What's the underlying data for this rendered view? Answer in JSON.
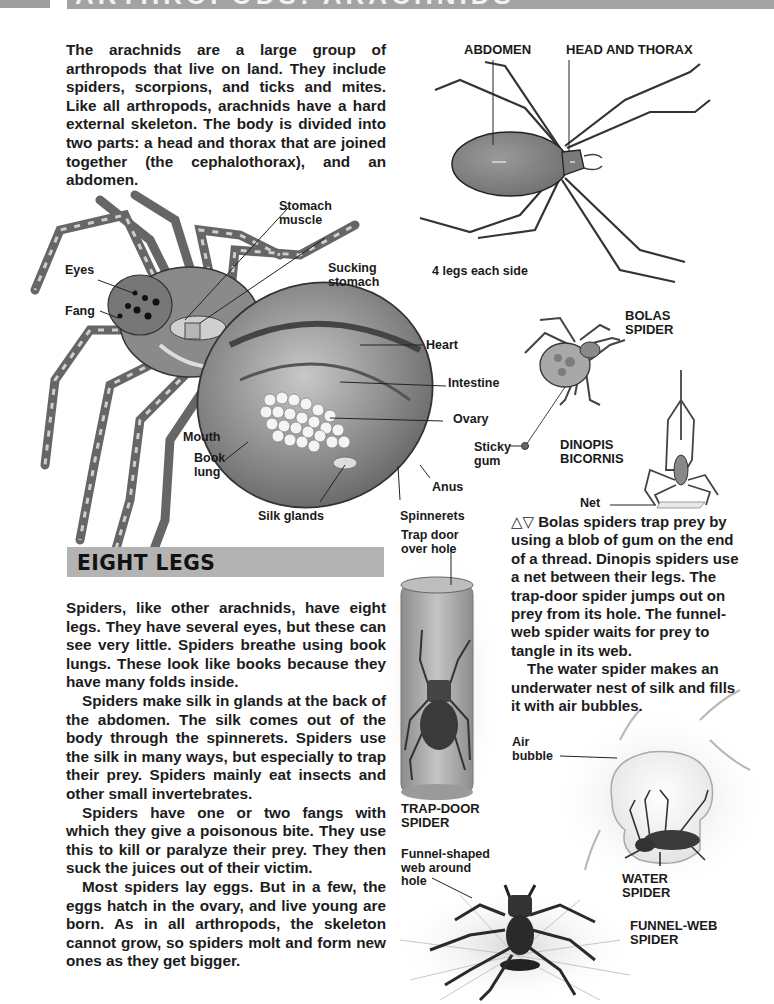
{
  "header": {
    "title": "ARTHROPODS: ARACHNIDS"
  },
  "intro": {
    "text": "The arachnids are a large group of arthropods that live on land. They include spiders, scorpions, and ticks and mites. Like all arthropods, arachnids have a hard external skeleton. The body is divided into two parts: a head and thorax that are joined together (the cephalothorax), and an abdomen."
  },
  "body_diagram": {
    "labels": {
      "abdomen": "ABDOMEN",
      "head_thorax": "HEAD AND THORAX",
      "legs_note": "4 legs each side"
    }
  },
  "anatomy": {
    "labels": {
      "stomach_muscle_1": "Stomach",
      "stomach_muscle_2": "muscle",
      "sucking_stomach_1": "Sucking",
      "sucking_stomach_2": "stomach",
      "eyes": "Eyes",
      "fang": "Fang",
      "heart": "Heart",
      "intestine": "Intestine",
      "ovary": "Ovary",
      "mouth": "Mouth",
      "book_lung_1": "Book",
      "book_lung_2": "lung",
      "anus": "Anus",
      "silk_glands": "Silk glands",
      "spinnerets": "Spinnerets"
    }
  },
  "side_figures": {
    "bolas_1": "BOLAS",
    "bolas_2": "SPIDER",
    "sticky_1": "Sticky",
    "sticky_2": "gum",
    "dinopis_1": "DINOPIS",
    "dinopis_2": "BICORNIS",
    "net": "Net",
    "trapdoor_label_1": "Trap door",
    "trapdoor_label_2": "over hole",
    "trapdoor_name_1": "TRAP-DOOR",
    "trapdoor_name_2": "SPIDER",
    "air_1": "Air",
    "air_2": "bubble",
    "water_1": "WATER",
    "water_2": "SPIDER",
    "funnel_label_1": "Funnel-shaped",
    "funnel_label_2": "web around",
    "funnel_label_3": "hole",
    "funnel_name_1": "FUNNEL-WEB",
    "funnel_name_2": "SPIDER"
  },
  "caption": {
    "p1": "△▽ Bolas spiders trap prey by using a blob of gum on the end of a thread. Dinopis spiders use a net between their legs. The trap-door spider jumps out on prey from its hole. The funnel-web spider waits for prey to tangle in its web.",
    "p2": "The water spider makes an underwater nest of silk and fills it with air bubbles."
  },
  "section": {
    "title": "EIGHT LEGS",
    "paragraphs": [
      "Spiders, like other arachnids, have eight legs. They have several eyes, but these can see very little. Spiders breathe using book lungs. These look like books because they have many folds inside.",
      "Spiders make silk in glands at the back of the abdomen. The silk comes out of the body through the spinnerets. Spiders use the silk in many ways, but especially to trap their prey. Spiders mainly eat insects and other small invertebrates.",
      "Spiders have one or two fangs with which they give a poisonous bite. They use this to kill or paralyze their prey. They then suck the juices out of their victim.",
      "Most spiders lay eggs. But in a few, the eggs hatch in the ovary, and live young are born. As in all arthropods, the skeleton cannot grow, so spiders molt and form new ones as they get bigger."
    ]
  },
  "colors": {
    "header_bar": "#a3a3a3",
    "section_bar": "#b3b3b3",
    "text": "#1c1c1c"
  }
}
